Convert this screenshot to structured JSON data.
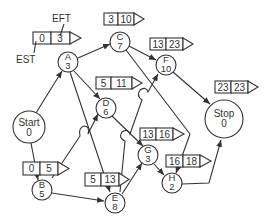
{
  "diagram": {
    "type": "activity-on-node network",
    "legend": {
      "est_label": "EST",
      "eft_label": "EFT"
    },
    "nodes": {
      "start": {
        "name": "Start",
        "duration": "0"
      },
      "a": {
        "name": "A",
        "duration": "3",
        "est": "0",
        "eft": "3"
      },
      "b": {
        "name": "B",
        "duration": "5",
        "est": "0",
        "eft": "5"
      },
      "c": {
        "name": "C",
        "duration": "7",
        "est": "3",
        "eft": "10"
      },
      "d": {
        "name": "D",
        "duration": "6",
        "est": "5",
        "eft": "11"
      },
      "e": {
        "name": "E",
        "duration": "8",
        "est": "5",
        "eft": "13"
      },
      "f": {
        "name": "F",
        "duration": "10",
        "est": "13",
        "eft": "23"
      },
      "g": {
        "name": "G",
        "duration": "3",
        "est": "13",
        "eft": "16"
      },
      "h": {
        "name": "H",
        "duration": "2",
        "est": "16",
        "eft": "18"
      },
      "stop": {
        "name": "Stop",
        "duration": "0",
        "est": "23",
        "eft": "23"
      }
    },
    "edges": [
      [
        "Start",
        "A"
      ],
      [
        "Start",
        "B"
      ],
      [
        "A",
        "C"
      ],
      [
        "A",
        "D"
      ],
      [
        "A",
        "E"
      ],
      [
        "B",
        "D"
      ],
      [
        "B",
        "E"
      ],
      [
        "C",
        "F"
      ],
      [
        "C",
        "H"
      ],
      [
        "D",
        "G"
      ],
      [
        "E",
        "F"
      ],
      [
        "E",
        "G"
      ],
      [
        "F",
        "Stop"
      ],
      [
        "G",
        "H"
      ],
      [
        "H",
        "Stop"
      ]
    ]
  }
}
